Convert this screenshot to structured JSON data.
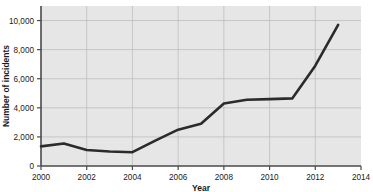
{
  "chart_data": {
    "type": "line",
    "title": "",
    "xlabel": "Year",
    "ylabel": "Number of incidents",
    "xlim": [
      2000,
      2014
    ],
    "ylim": [
      0,
      11000
    ],
    "grid": true,
    "legend": null,
    "xticks": [
      "2000",
      "2002",
      "2004",
      "2006",
      "2008",
      "2010",
      "2012",
      "2014"
    ],
    "xtick_values": [
      2000,
      2002,
      2004,
      2006,
      2008,
      2010,
      2012,
      2014
    ],
    "yticks": [
      "0",
      "2,000",
      "4,000",
      "6,000",
      "8,000",
      "10,000"
    ],
    "ytick_values": [
      0,
      2000,
      4000,
      6000,
      8000,
      10000
    ],
    "x": [
      2000,
      2001,
      2002,
      2003,
      2004,
      2005,
      2006,
      2007,
      2008,
      2009,
      2010,
      2011,
      2012,
      2013
    ],
    "series": [
      {
        "name": "Number of incidents",
        "color": "#2b2b2b",
        "values": [
          1350,
          1550,
          1100,
          1000,
          950,
          1750,
          2500,
          2900,
          4300,
          4550,
          4600,
          4650,
          6900,
          9700
        ]
      }
    ]
  },
  "style": {
    "plot_background": "#e6e6e6",
    "grid_color": "#b9b9b9",
    "axis_color": "#4a4a4a",
    "text_color": "#1a1a1a",
    "line_color": "#2b2b2b",
    "page_background": "#ffffff"
  }
}
